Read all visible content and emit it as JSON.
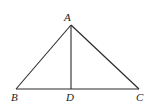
{
  "diagram": {
    "type": "geometry-triangle",
    "stroke_color": "#2a2a2a",
    "background": "#ffffff",
    "points": {
      "A": {
        "label": "A",
        "x": 71,
        "y": 25
      },
      "B": {
        "label": "B",
        "x": 16,
        "y": 89
      },
      "C": {
        "label": "C",
        "x": 139,
        "y": 89
      },
      "D": {
        "label": "D",
        "x": 71,
        "y": 89
      }
    },
    "segments": [
      {
        "name": "AB",
        "from": "A",
        "to": "B"
      },
      {
        "name": "AC",
        "from": "A",
        "to": "C"
      },
      {
        "name": "BC",
        "from": "B",
        "to": "C"
      },
      {
        "name": "AD",
        "from": "A",
        "to": "D"
      }
    ],
    "labels": {
      "A": "A",
      "B": "B",
      "C": "C",
      "D": "D"
    }
  }
}
